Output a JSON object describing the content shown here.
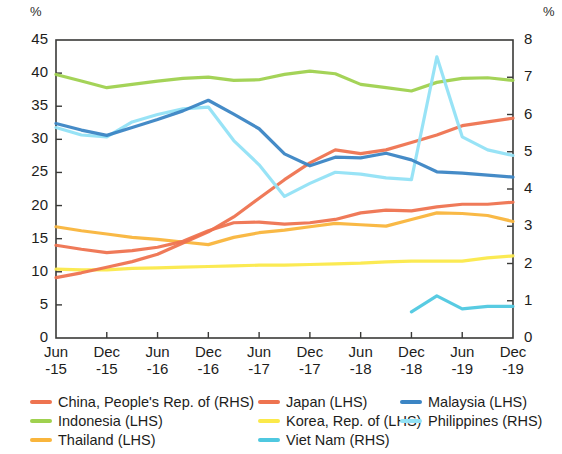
{
  "axes": {
    "left_unit": "%",
    "right_unit": "%",
    "left_ticks": [
      "45",
      "40",
      "35",
      "30",
      "25",
      "20",
      "15",
      "10",
      "5",
      "0"
    ],
    "right_ticks": [
      "8",
      "7",
      "6",
      "5",
      "4",
      "3",
      "2",
      "1",
      "0"
    ],
    "x_ticks": [
      {
        "month": "Jun",
        "year": "-15"
      },
      {
        "month": "Dec",
        "year": "-15"
      },
      {
        "month": "Jun",
        "year": "-16"
      },
      {
        "month": "Dec",
        "year": "-16"
      },
      {
        "month": "Jun",
        "year": "-17"
      },
      {
        "month": "Dec",
        "year": "-17"
      },
      {
        "month": "Jun",
        "year": "-18"
      },
      {
        "month": "Dec",
        "year": "-18"
      },
      {
        "month": "Jun",
        "year": "-19"
      },
      {
        "month": "Dec",
        "year": "-19"
      }
    ]
  },
  "legend": {
    "columns": [
      {
        "items": [
          {
            "label": "China, People's Rep. of (RHS)",
            "color": "#ee7350"
          },
          {
            "label": "Indonesia (LHS)",
            "color": "#9fd14f"
          },
          {
            "label": "Thailand (LHS)",
            "color": "#f9b53c"
          }
        ]
      },
      {
        "items": [
          {
            "label": "Japan (LHS)",
            "color": "#ee7350"
          },
          {
            "label": "Korea, Rep. of (LHS)",
            "color": "#fbe94a"
          },
          {
            "label": "Viet Nam (RHS)",
            "color": "#4fc8e0"
          }
        ]
      },
      {
        "items": [
          {
            "label": "Malaysia (LHS)",
            "color": "#3b85c4"
          },
          {
            "label": "Philippines (RHS)",
            "color": "#92e2f5"
          }
        ]
      }
    ]
  },
  "chart_data": {
    "type": "line",
    "title": "",
    "xlabel": "",
    "ylabel": "%",
    "y2label": "%",
    "ylim": [
      0,
      45
    ],
    "y2lim": [
      0,
      8
    ],
    "grid": false,
    "legend_position": "bottom",
    "x": [
      "Jun-15",
      "Sep-15",
      "Dec-15",
      "Mar-16",
      "Jun-16",
      "Sep-16",
      "Dec-16",
      "Mar-17",
      "Jun-17",
      "Sep-17",
      "Dec-17",
      "Mar-18",
      "Jun-18",
      "Sep-18",
      "Dec-18",
      "Mar-19",
      "Jun-19",
      "Sep-19",
      "Dec-19"
    ],
    "series": [
      {
        "name": "China, People's Rep. of (RHS)",
        "axis": "right",
        "color": "#ee7350",
        "values": [
          1.62,
          1.75,
          1.9,
          2.05,
          2.25,
          2.55,
          2.85,
          3.25,
          3.75,
          4.25,
          4.7,
          5.05,
          4.95,
          5.05,
          5.25,
          5.45,
          5.7,
          5.8,
          5.9
        ]
      },
      {
        "name": "Indonesia (LHS)",
        "axis": "left",
        "color": "#9fd14f",
        "values": [
          39.8,
          38.8,
          37.8,
          38.3,
          38.8,
          39.2,
          39.4,
          38.9,
          39.0,
          39.8,
          40.3,
          39.9,
          38.3,
          37.8,
          37.3,
          38.6,
          39.2,
          39.3,
          38.9
        ]
      },
      {
        "name": "Thailand (LHS)",
        "axis": "left",
        "color": "#f9b53c",
        "values": [
          16.8,
          16.2,
          15.7,
          15.2,
          14.9,
          14.5,
          14.1,
          15.2,
          15.9,
          16.3,
          16.8,
          17.3,
          17.1,
          16.9,
          17.9,
          18.9,
          18.8,
          18.5,
          17.6
        ]
      },
      {
        "name": "Japan (LHS)",
        "axis": "left",
        "color": "#ee7350",
        "values": [
          14.0,
          13.4,
          12.9,
          13.2,
          13.7,
          14.6,
          16.2,
          17.4,
          17.5,
          17.2,
          17.4,
          17.9,
          18.9,
          19.3,
          19.2,
          19.8,
          20.2,
          20.2,
          20.5
        ]
      },
      {
        "name": "Korea, Rep. of (LHS)",
        "axis": "left",
        "color": "#fbe94a",
        "values": [
          10.4,
          10.3,
          10.3,
          10.5,
          10.6,
          10.7,
          10.8,
          10.9,
          11.0,
          11.0,
          11.1,
          11.2,
          11.3,
          11.5,
          11.6,
          11.6,
          11.6,
          12.1,
          12.4
        ]
      },
      {
        "name": "Malaysia (LHS)",
        "axis": "left",
        "color": "#3b85c4",
        "values": [
          32.4,
          31.4,
          30.6,
          31.8,
          33.0,
          34.3,
          35.9,
          33.8,
          31.6,
          27.8,
          26.0,
          27.3,
          27.2,
          27.9,
          26.9,
          25.1,
          24.9,
          24.6,
          24.3
        ]
      },
      {
        "name": "Philippines (RHS)",
        "axis": "right",
        "color": "#92e2f5",
        "values": [
          5.65,
          5.45,
          5.4,
          5.8,
          6.0,
          6.15,
          6.2,
          5.3,
          4.65,
          3.8,
          4.15,
          4.45,
          4.4,
          4.3,
          4.25,
          7.55,
          5.4,
          5.05,
          4.9
        ]
      },
      {
        "name": "Viet Nam (RHS)",
        "axis": "right",
        "color": "#4fc8e0",
        "values": [
          null,
          null,
          null,
          null,
          null,
          null,
          null,
          null,
          null,
          null,
          null,
          null,
          null,
          null,
          0.7,
          1.13,
          0.78,
          0.85,
          0.85
        ]
      }
    ]
  }
}
